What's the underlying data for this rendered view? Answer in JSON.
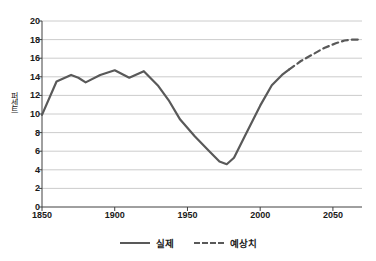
{
  "chart_data": {
    "type": "line",
    "title": "",
    "xlabel": "",
    "ylabel": "퍼센트",
    "xlim": [
      1850,
      2070
    ],
    "ylim": [
      0,
      20
    ],
    "grid": true,
    "legend_position": "bottom",
    "yticks": [
      0,
      2,
      4,
      6,
      8,
      10,
      12,
      14,
      16,
      18,
      20
    ],
    "xticks": [
      1850,
      1900,
      1950,
      2000,
      2050
    ],
    "colors": {
      "line": "#595959",
      "grid": "#bfbfbf",
      "axis": "#404040",
      "text": "#1a1a1a"
    },
    "series": [
      {
        "name": "실제",
        "style": "solid",
        "x": [
          1850,
          1860,
          1870,
          1875,
          1880,
          1890,
          1900,
          1910,
          1920,
          1930,
          1937,
          1945,
          1955,
          1965,
          1972,
          1977,
          1982,
          1990,
          2000,
          2008,
          2015,
          2020
        ],
        "values": [
          9.9,
          13.5,
          14.2,
          13.9,
          13.4,
          14.2,
          14.7,
          13.9,
          14.6,
          13.0,
          11.5,
          9.4,
          7.6,
          6.0,
          4.9,
          4.6,
          5.3,
          7.8,
          10.9,
          13.1,
          14.2,
          14.8
        ]
      },
      {
        "name": "예상치",
        "style": "dashed",
        "x": [
          2020,
          2028,
          2036,
          2044,
          2052,
          2058,
          2063,
          2068
        ],
        "values": [
          14.8,
          15.7,
          16.4,
          17.1,
          17.6,
          17.9,
          18.0,
          18.0
        ]
      }
    ],
    "legend": [
      {
        "label": "실제",
        "style": "solid"
      },
      {
        "label": "예상치",
        "style": "dashed"
      }
    ]
  }
}
